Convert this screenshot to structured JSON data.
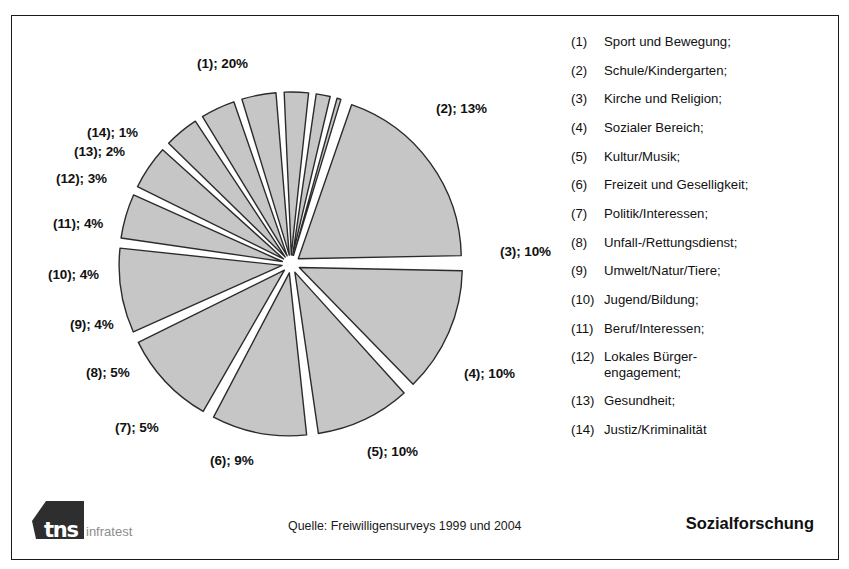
{
  "chart_data": {
    "type": "pie",
    "title": "",
    "legend_position": "right",
    "exploded": true,
    "start_angle_deg": -72,
    "categories": [
      "Sport und Bewegung",
      "Schule/Kindergarten",
      "Kirche und Religion",
      "Sozialer Bereich",
      "Kultur/Musik",
      "Freizeit und Geselligkeit",
      "Politik/Interessen",
      "Unfall-/Rettungsdienst",
      "Umwelt/Natur/Tiere",
      "Jugend/Bildung",
      "Beruf/Interessen",
      "Lokales Bürgerengagement",
      "Gesundheit",
      "Justiz/Kriminalität"
    ],
    "values": [
      20,
      13,
      10,
      10,
      10,
      9,
      5,
      5,
      4,
      4,
      4,
      3,
      2,
      1
    ],
    "unit": "%",
    "slice_fill": "#c6c6c6",
    "slice_stroke": "#2b2b2b",
    "labels": [
      {
        "key": "s1",
        "text": "(1); 20%",
        "x": 185,
        "y": 40
      },
      {
        "key": "s2",
        "text": "(2); 13%",
        "x": 424,
        "y": 85
      },
      {
        "key": "s3",
        "text": "(3); 10%",
        "x": 488,
        "y": 228
      },
      {
        "key": "s4",
        "text": "(4); 10%",
        "x": 452,
        "y": 350
      },
      {
        "key": "s5",
        "text": "(5); 10%",
        "x": 355,
        "y": 428
      },
      {
        "key": "s6",
        "text": "(6); 9%",
        "x": 198,
        "y": 437
      },
      {
        "key": "s7",
        "text": "(7); 5%",
        "x": 103,
        "y": 404
      },
      {
        "key": "s8",
        "text": "(8); 5%",
        "x": 74,
        "y": 349
      },
      {
        "key": "s9",
        "text": "(9); 4%",
        "x": 58,
        "y": 301
      },
      {
        "key": "s10",
        "text": "(10); 4%",
        "x": 36,
        "y": 251
      },
      {
        "key": "s11",
        "text": "(11); 4%",
        "x": 41,
        "y": 200
      },
      {
        "key": "s12",
        "text": "(12); 3%",
        "x": 44,
        "y": 155
      },
      {
        "key": "s13",
        "text": "(13); 2%",
        "x": 62,
        "y": 128
      },
      {
        "key": "s14",
        "text": "(14); 1%",
        "x": 75,
        "y": 109
      }
    ]
  },
  "legend": {
    "items": [
      {
        "num": "(1)",
        "label": "Sport und Bewegung;"
      },
      {
        "num": "(2)",
        "label": "Schule/Kindergarten;"
      },
      {
        "num": "(3)",
        "label": "Kirche und Religion;"
      },
      {
        "num": "(4)",
        "label": "Sozialer Bereich;"
      },
      {
        "num": "(5)",
        "label": "Kultur/Musik;"
      },
      {
        "num": "(6)",
        "label": "Freizeit und Geselligkeit;"
      },
      {
        "num": "(7)",
        "label": "Politik/Interessen;"
      },
      {
        "num": "(8)",
        "label": "Unfall-/Rettungsdienst;"
      },
      {
        "num": "(9)",
        "label": "Umwelt/Natur/Tiere;"
      },
      {
        "num": "(10)",
        "label": "Jugend/Bildung;"
      },
      {
        "num": "(11)",
        "label": "Beruf/Interessen;"
      },
      {
        "num": "(12)",
        "label": "Lokales Bürger-",
        "label2": "engagement;"
      },
      {
        "num": "(13)",
        "label": "Gesundheit;"
      },
      {
        "num": "(14)",
        "label": "Justiz/Kriminalität"
      }
    ]
  },
  "footer": {
    "logo_text": "tns",
    "logo_suffix": "infratest",
    "source": "Quelle: Freiwilligensurveys 1999 und 2004",
    "brand": "Sozialforschung"
  }
}
